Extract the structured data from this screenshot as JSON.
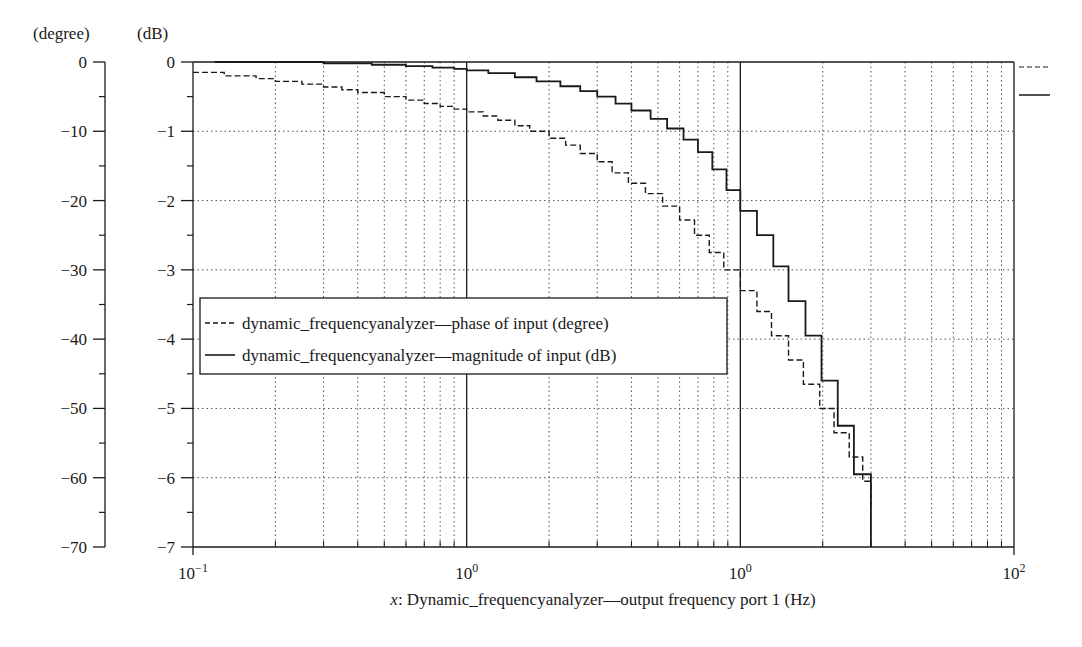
{
  "chart_data": {
    "type": "line",
    "title": "",
    "xlabel_prefix": "x",
    "xlabel": ": Dynamic_frequencyanalyzer—output frequency port 1 (Hz)",
    "xscale": "log",
    "xlim": [
      0.1,
      100
    ],
    "x_tick_labels": [
      {
        "base": "10",
        "exp": "−1"
      },
      {
        "base": "10",
        "exp": "0"
      },
      {
        "base": "10",
        "exp": "0"
      },
      {
        "base": "10",
        "exp": "2"
      }
    ],
    "y_left": {
      "unit_label": "(degree)",
      "ylim": [
        -70,
        0
      ],
      "tick_labels": [
        "0",
        "−10",
        "−20",
        "−30",
        "−40",
        "−50",
        "−60",
        "−70"
      ]
    },
    "y_right": {
      "unit_label": "(dB)",
      "ylim": [
        -7,
        0
      ],
      "tick_labels": [
        "0",
        "−1",
        "−2",
        "−3",
        "−4",
        "−5",
        "−6",
        "−7"
      ]
    },
    "grid": true,
    "legend_position": "center-left",
    "series": [
      {
        "name": "dynamic_frequencyanalyzer—phase of input (degree)",
        "style": "dashed",
        "axis": "degree",
        "x": [
          0.1,
          0.13,
          0.17,
          0.2,
          0.25,
          0.3,
          0.35,
          0.4,
          0.5,
          0.6,
          0.7,
          0.8,
          0.9,
          1.0,
          1.15,
          1.3,
          1.5,
          1.7,
          2.0,
          2.3,
          2.6,
          3.0,
          3.4,
          3.9,
          4.5,
          5.2,
          6.0,
          6.8,
          7.7,
          8.7,
          10.0,
          11.5,
          13.0,
          15.0,
          17.0,
          19.5,
          22.0,
          25.0,
          28.0,
          30.0
        ],
        "y": [
          -1.5,
          -2.0,
          -2.4,
          -2.8,
          -3.2,
          -3.6,
          -4.0,
          -4.4,
          -5.0,
          -5.5,
          -6.0,
          -6.4,
          -6.8,
          -7.2,
          -7.8,
          -8.4,
          -9.2,
          -10.0,
          -11.0,
          -12.0,
          -13.2,
          -14.4,
          -16.0,
          -17.5,
          -19.0,
          -20.8,
          -22.8,
          -25.0,
          -27.5,
          -30.0,
          -33.0,
          -36.0,
          -39.5,
          -43.0,
          -46.5,
          -50.0,
          -53.5,
          -57.0,
          -60.5,
          -64.0
        ]
      },
      {
        "name": "dynamic_frequencyanalyzer—magnitude of input (dB)",
        "style": "solid",
        "axis": "dB",
        "x": [
          0.12,
          0.3,
          0.45,
          0.6,
          0.75,
          0.9,
          1.0,
          1.2,
          1.5,
          1.8,
          2.2,
          2.6,
          3.0,
          3.5,
          4.0,
          4.7,
          5.4,
          6.2,
          7.0,
          7.9,
          8.9,
          10.0,
          11.5,
          13.2,
          15.0,
          17.3,
          19.8,
          22.7,
          26.0,
          30.0
        ],
        "y": [
          0.0,
          -0.02,
          -0.04,
          -0.06,
          -0.08,
          -0.1,
          -0.12,
          -0.16,
          -0.22,
          -0.28,
          -0.35,
          -0.42,
          -0.5,
          -0.6,
          -0.7,
          -0.82,
          -0.96,
          -1.12,
          -1.3,
          -1.55,
          -1.85,
          -2.15,
          -2.5,
          -2.95,
          -3.45,
          -3.95,
          -4.6,
          -5.25,
          -5.95,
          -6.75
        ]
      }
    ]
  }
}
